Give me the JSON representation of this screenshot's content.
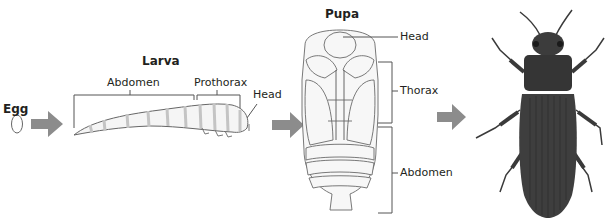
{
  "diagram": {
    "type": "life-cycle",
    "stages": [
      {
        "id": "egg",
        "title": "Egg"
      },
      {
        "id": "larva",
        "title": "Larva",
        "parts": [
          "Abdomen",
          "Prothorax",
          "Head"
        ]
      },
      {
        "id": "pupa",
        "title": "Pupa",
        "parts": [
          "Head",
          "Thorax",
          "Abdomen"
        ]
      },
      {
        "id": "adult",
        "title": ""
      }
    ],
    "colors": {
      "arrow": "#8c8c8c",
      "larva_fill": "#f4f4f4",
      "larva_stripe": "#c9c9c9",
      "outline": "#555555",
      "beetle": "#3c3c3c",
      "beetle_dark": "#262626"
    }
  }
}
